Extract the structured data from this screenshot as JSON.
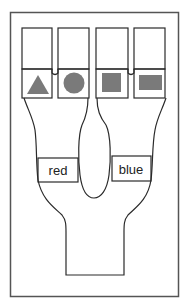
{
  "diagram": {
    "compartments": [
      {
        "id": 1,
        "shape": "triangle"
      },
      {
        "id": 2,
        "shape": "circle"
      },
      {
        "id": 3,
        "shape": "square"
      },
      {
        "id": 4,
        "shape": "rectangle"
      }
    ],
    "labels": {
      "left": "red",
      "right": "blue"
    },
    "colors": {
      "shape_fill": "#7a7a7a",
      "stroke": "#2a2a2a",
      "frame": "#555555",
      "background": "#ffffff"
    }
  }
}
